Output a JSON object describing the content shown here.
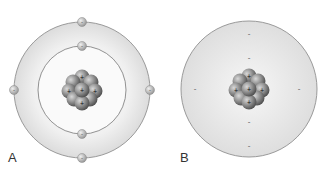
{
  "panels": [
    {
      "label": "A",
      "model": "bohr",
      "electron_sign": "-",
      "proton_sign": "+",
      "shells": 2,
      "electrons_inner": 2,
      "electrons_outer": 4
    },
    {
      "label": "B",
      "model": "electron-cloud",
      "electron_sign": "-",
      "proton_sign": "+"
    }
  ],
  "colors": {
    "cloud": "#e2e2e2",
    "orbit": "#8a8a8a",
    "nucleus": "#808080",
    "electron": "#b8b8b8"
  }
}
